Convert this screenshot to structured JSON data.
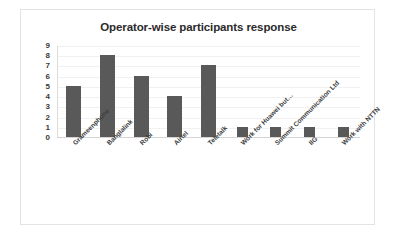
{
  "chart_data": {
    "type": "bar",
    "title": "Operator-wise participants response",
    "xlabel": "",
    "ylabel": "",
    "ylim": [
      0,
      9
    ],
    "ytick_labels": [
      "9",
      "8",
      "7",
      "6",
      "5",
      "4",
      "3",
      "2",
      "1",
      "0"
    ],
    "grid": true,
    "legend": false,
    "bar_color": "#595959",
    "categories": [
      "Grameenphone",
      "Banglalink",
      "Robi",
      "Airtel",
      "Teletalk",
      "Work for Huawei but…",
      "Summit Communication Ltd",
      "IIG",
      "Work with NTTN"
    ],
    "values": [
      5,
      8,
      6,
      4,
      7,
      1,
      1,
      1,
      1
    ]
  }
}
